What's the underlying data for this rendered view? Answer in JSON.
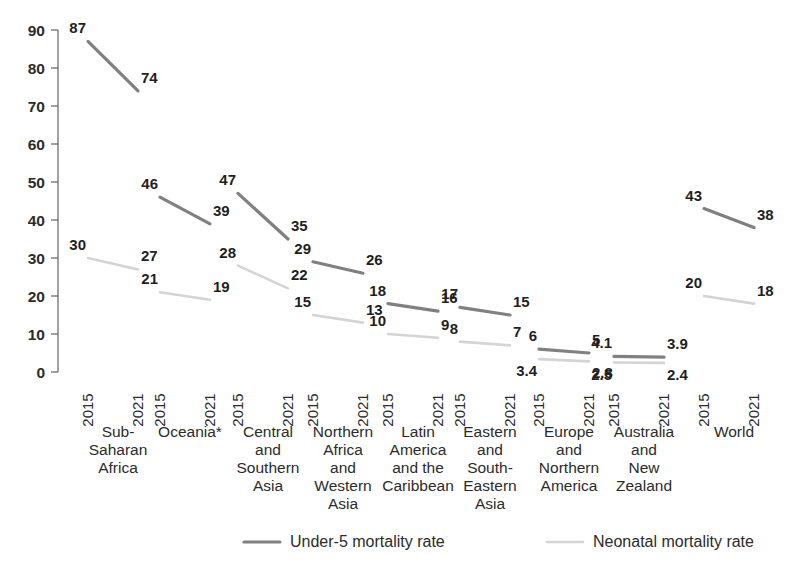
{
  "chart_data": {
    "type": "line",
    "title": "",
    "xlabel": "",
    "ylabel": "",
    "ylim": [
      0,
      90
    ],
    "ytick_values": [
      0,
      10,
      20,
      30,
      40,
      50,
      60,
      70,
      80,
      90
    ],
    "grid": false,
    "legend_position": "bottom",
    "x_years": [
      "2015",
      "2021"
    ],
    "categories": [
      "Sub-Saharan Africa",
      "Oceania*",
      "Central and Southern Asia",
      "Northern Africa and Western Asia",
      "Latin America and the Caribbean",
      "Eastern and South-Eastern Asia",
      "Europe and Northern America",
      "Australia and New Zealand",
      "World"
    ],
    "series": [
      {
        "name": "Under-5 mortality rate",
        "color": "#808080",
        "values": [
          [
            87,
            74
          ],
          [
            46,
            39
          ],
          [
            47,
            35
          ],
          [
            29,
            26
          ],
          [
            18,
            16
          ],
          [
            17,
            15
          ],
          [
            6,
            5
          ],
          [
            4.1,
            3.9
          ],
          [
            43,
            38
          ]
        ],
        "labels": [
          [
            "87",
            "74"
          ],
          [
            "46",
            "39"
          ],
          [
            "47",
            "35"
          ],
          [
            "29",
            "26"
          ],
          [
            "18",
            "16"
          ],
          [
            "17",
            "15"
          ],
          [
            "6",
            "5"
          ],
          [
            "4.1",
            "3.9"
          ],
          [
            "43",
            "38"
          ]
        ]
      },
      {
        "name": "Neonatal mortality rate",
        "color": "#d4d4d4",
        "values": [
          [
            30,
            27
          ],
          [
            21,
            19
          ],
          [
            28,
            22
          ],
          [
            15,
            13
          ],
          [
            10,
            9
          ],
          [
            8,
            7
          ],
          [
            3.4,
            2.8
          ],
          [
            2.5,
            2.4
          ],
          [
            20,
            18
          ]
        ],
        "labels": [
          [
            "30",
            "27"
          ],
          [
            "21",
            "19"
          ],
          [
            "28",
            "22"
          ],
          [
            "15",
            "13"
          ],
          [
            "10",
            "9"
          ],
          [
            "8",
            "7"
          ],
          [
            "3.4",
            "2.8"
          ],
          [
            "2.5",
            "2.4"
          ],
          [
            "20",
            "18"
          ]
        ]
      }
    ]
  },
  "axis": {
    "y_ticks": [
      {
        "label": "90",
        "value": 90
      },
      {
        "label": "80",
        "value": 80
      },
      {
        "label": "70",
        "value": 70
      },
      {
        "label": "60",
        "value": 60
      },
      {
        "label": "50",
        "value": 50
      },
      {
        "label": "40",
        "value": 40
      },
      {
        "label": "30",
        "value": 30
      },
      {
        "label": "20",
        "value": 20
      },
      {
        "label": "10",
        "value": 10
      },
      {
        "label": "0",
        "value": 0
      }
    ]
  },
  "x_axis_groups": [
    {
      "region_lines": [
        "Sub-",
        "Saharan",
        "Africa"
      ],
      "years": [
        "2015",
        "2021"
      ]
    },
    {
      "region_lines": [
        "Oceania*"
      ],
      "years": [
        "2015",
        "2021"
      ]
    },
    {
      "region_lines": [
        "Central",
        "and",
        "Southern",
        "Asia"
      ],
      "years": [
        "2015",
        "2021"
      ]
    },
    {
      "region_lines": [
        "Northern",
        "Africa",
        "and",
        "Western",
        "Asia"
      ],
      "years": [
        "2015",
        "2021"
      ]
    },
    {
      "region_lines": [
        "Latin",
        "America",
        "and the",
        "Caribbean"
      ],
      "years": [
        "2015",
        "2021"
      ]
    },
    {
      "region_lines": [
        "Eastern",
        "and",
        "South-",
        "Eastern",
        "Asia"
      ],
      "years": [
        "2015",
        "2021"
      ]
    },
    {
      "region_lines": [
        "Europe",
        "and",
        "Northern",
        "America"
      ],
      "years": [
        "2015",
        "2021"
      ]
    },
    {
      "region_lines": [
        "Australia",
        "and",
        "New",
        "Zealand"
      ],
      "years": [
        "2015",
        "2021"
      ]
    },
    {
      "region_lines": [
        "World"
      ],
      "years": [
        "2015",
        "2021"
      ]
    }
  ],
  "legend": {
    "items": [
      {
        "label": "Under-5 mortality rate",
        "color": "#808080"
      },
      {
        "label": "Neonatal mortality rate",
        "color": "#d4d4d4"
      }
    ]
  }
}
